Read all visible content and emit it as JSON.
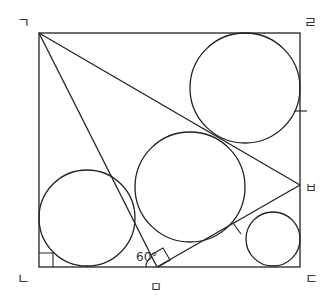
{
  "diagram": {
    "stroke_color": "#222222",
    "background": "#ffffff",
    "square": {
      "x1": 39,
      "y1": 33,
      "x2": 300,
      "y2": 267
    },
    "vertex_labels": {
      "top_left": "ㄱ",
      "top_right": "ㄹ",
      "bottom_left": "ㄴ",
      "bottom_right": "ㄷ",
      "right_side_point": "ㅂ",
      "bottom_side_point": "ㅁ"
    },
    "points": {
      "top_left": [
        39,
        33
      ],
      "top_right": [
        300,
        33
      ],
      "bottom_right": [
        300,
        267
      ],
      "bottom_left": [
        39,
        267
      ],
      "right_side_point": [
        300,
        185
      ],
      "bottom_side_point": [
        157,
        267
      ]
    },
    "segments": [
      {
        "from": "top_left",
        "to": "right_side_point"
      },
      {
        "from": "top_left",
        "to": "bottom_side_point"
      },
      {
        "from": "bottom_side_point",
        "to": "right_side_point"
      }
    ],
    "circles": [
      {
        "name": "top-right-circle",
        "cx": 245,
        "cy": 88,
        "r": 55
      },
      {
        "name": "middle-circle",
        "cx": 190,
        "cy": 187,
        "r": 55
      },
      {
        "name": "left-circle",
        "cx": 87,
        "cy": 218,
        "r": 48
      },
      {
        "name": "small-circle",
        "cx": 273,
        "cy": 239,
        "r": 27
      }
    ],
    "angle_label": "60°",
    "right_angle_marks": [
      "bottom_left corner",
      "bottom_side_point (between segments)"
    ],
    "tick_marks": [
      "right side near y=111",
      "segment near (237,228)"
    ]
  }
}
